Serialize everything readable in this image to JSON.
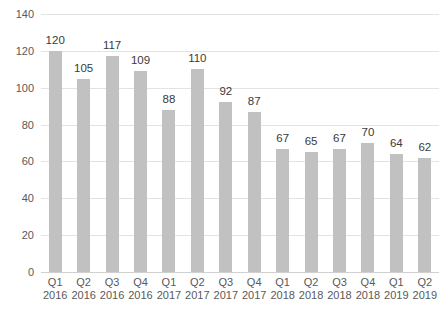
{
  "chart_data": {
    "type": "bar",
    "title": "",
    "xlabel": "",
    "ylabel": "",
    "categories": [
      {
        "quarter": "Q1",
        "year": "2016"
      },
      {
        "quarter": "Q2",
        "year": "2016"
      },
      {
        "quarter": "Q3",
        "year": "2016"
      },
      {
        "quarter": "Q4",
        "year": "2016"
      },
      {
        "quarter": "Q1",
        "year": "2017"
      },
      {
        "quarter": "Q2",
        "year": "2017"
      },
      {
        "quarter": "Q3",
        "year": "2017"
      },
      {
        "quarter": "Q4",
        "year": "2017"
      },
      {
        "quarter": "Q1",
        "year": "2018"
      },
      {
        "quarter": "Q2",
        "year": "2018"
      },
      {
        "quarter": "Q3",
        "year": "2018"
      },
      {
        "quarter": "Q4",
        "year": "2018"
      },
      {
        "quarter": "Q1",
        "year": "2019"
      },
      {
        "quarter": "Q2",
        "year": "2019"
      }
    ],
    "values": [
      120,
      105,
      117,
      109,
      88,
      110,
      92,
      87,
      67,
      65,
      67,
      70,
      64,
      62
    ],
    "data_labels_shown": true,
    "ylim": [
      0,
      140
    ],
    "y_ticks": [
      0,
      20,
      40,
      60,
      80,
      100,
      120,
      140
    ],
    "grid": true,
    "legend": "none",
    "colors": {
      "bar_fill": "#c1c1c1",
      "data_label": "#3a3a3a",
      "axis_tick_label": "#595959",
      "gridline": "#e3e3e3",
      "axis_line": "#d0d0d0",
      "background": "#ffffff"
    }
  }
}
